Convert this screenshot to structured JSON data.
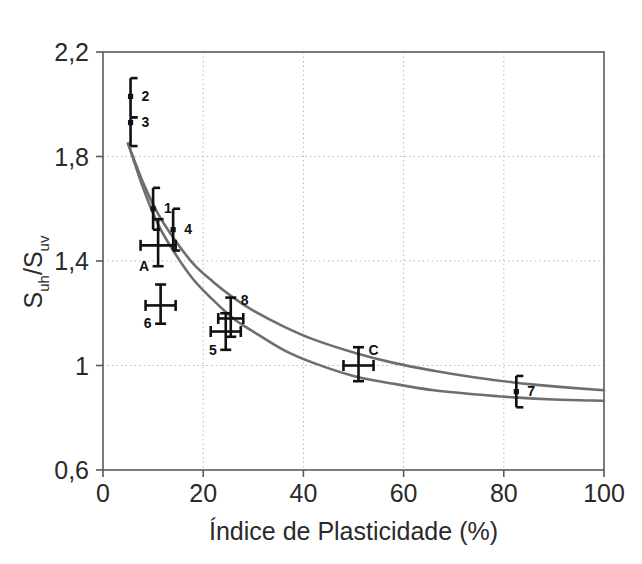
{
  "chart_data": {
    "type": "scatter",
    "title": "",
    "xlabel": "Índice de Plasticidade (%)",
    "ylabel": "Suh/Suv",
    "ylabel_parts": {
      "base1": "S",
      "sub1": "uh",
      "slash": "/",
      "base2": "S",
      "sub2": "uv"
    },
    "xlim": [
      0,
      100
    ],
    "ylim": [
      0.6,
      2.2
    ],
    "xticks": [
      0,
      20,
      40,
      60,
      80,
      100
    ],
    "xtick_labels": [
      "0",
      "20",
      "40",
      "60",
      "80",
      "100"
    ],
    "yticks": [
      0.6,
      1.0,
      1.4,
      1.8,
      2.2
    ],
    "ytick_labels": [
      "0,6",
      "1",
      "1,4",
      "1,8",
      "2,2"
    ],
    "grid": true,
    "grid_style": "dotted",
    "legend": "none",
    "marker_style": "error-bars-with-labels",
    "points": [
      {
        "label": "2",
        "x": 5.5,
        "y": 2.03,
        "ylow": 1.95,
        "yhigh": 2.1,
        "xerr": 0,
        "style": "bracket"
      },
      {
        "label": "3",
        "x": 5.5,
        "y": 1.93,
        "ylow": 1.84,
        "yhigh": 1.95,
        "xerr": 0,
        "style": "bracket"
      },
      {
        "label": "1",
        "x": 10.0,
        "y": 1.6,
        "ylow": 1.52,
        "yhigh": 1.68,
        "xerr": 0,
        "style": "bracket"
      },
      {
        "label": "4",
        "x": 14.0,
        "y": 1.52,
        "ylow": 1.44,
        "yhigh": 1.6,
        "xerr": 0,
        "style": "bracket"
      },
      {
        "label": "A",
        "x": 11.0,
        "y": 1.46,
        "ylow": 1.38,
        "yhigh": 1.56,
        "xerr": 3.5,
        "style": "cross"
      },
      {
        "label": "6",
        "x": 11.5,
        "y": 1.23,
        "ylow": 1.16,
        "yhigh": 1.31,
        "xerr": 3.0,
        "style": "cross"
      },
      {
        "label": "8",
        "x": 25.5,
        "y": 1.18,
        "ylow": 1.11,
        "yhigh": 1.26,
        "xerr": 2.5,
        "style": "cross"
      },
      {
        "label": "5",
        "x": 24.5,
        "y": 1.13,
        "ylow": 1.06,
        "yhigh": 1.2,
        "xerr": 3.0,
        "style": "cross"
      },
      {
        "label": "C",
        "x": 51.0,
        "y": 1.0,
        "ylow": 0.94,
        "yhigh": 1.07,
        "xerr": 3.0,
        "style": "cross"
      },
      {
        "label": "7",
        "x": 82.5,
        "y": 0.9,
        "ylow": 0.84,
        "yhigh": 0.96,
        "xerr": 0,
        "style": "bracket"
      }
    ],
    "series": [
      {
        "name": "upper-curve",
        "color": "#6e6e6e",
        "x": [
          5,
          8,
          11,
          14,
          18,
          22,
          26,
          30,
          36,
          42,
          50,
          58,
          66,
          74,
          82,
          90,
          100
        ],
        "y": [
          1.85,
          1.7,
          1.58,
          1.49,
          1.39,
          1.32,
          1.26,
          1.21,
          1.15,
          1.1,
          1.05,
          1.01,
          0.98,
          0.955,
          0.935,
          0.92,
          0.905
        ]
      },
      {
        "name": "lower-curve",
        "color": "#6e6e6e",
        "x": [
          5,
          8,
          11,
          14,
          18,
          22,
          26,
          30,
          36,
          42,
          50,
          58,
          66,
          74,
          82,
          90,
          100
        ],
        "y": [
          1.85,
          1.68,
          1.54,
          1.44,
          1.33,
          1.25,
          1.18,
          1.13,
          1.06,
          1.01,
          0.96,
          0.93,
          0.905,
          0.89,
          0.878,
          0.87,
          0.865
        ]
      }
    ],
    "colors": {
      "curve": "#6e6e6e",
      "axis": "#5a5a5a",
      "grid": "#b9b9b9",
      "marker": "#111111",
      "text": "#2a2a2a",
      "background": "#ffffff"
    }
  }
}
